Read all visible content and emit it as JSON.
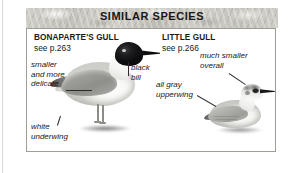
{
  "header": {
    "title": "SIMILAR SPECIES"
  },
  "species": [
    {
      "id": "bonapartes-gull",
      "name": "BONAPARTE'S GULL",
      "page_reference": "see p.263",
      "illustration": "standing-gull-black-hood"
    },
    {
      "id": "little-gull",
      "name": "LITTLE GULL",
      "page_reference": "see p.266",
      "illustration": "sitting-gull-dark-eye-patch"
    }
  ],
  "annotations": [
    {
      "id": "smaller-and-more-delicate",
      "line1": "smaller",
      "line2": "and more",
      "line3": "delicate",
      "points_to": "bonapartes-gull-body"
    },
    {
      "id": "black-bill",
      "line1": "black",
      "line2": "bill",
      "points_to": "bonapartes-gull-bill"
    },
    {
      "id": "white-underwing",
      "line1": "white",
      "line2": "underwing",
      "points_to": "bonapartes-gull-underwing"
    },
    {
      "id": "much-smaller-overall",
      "line1": "much smaller",
      "line2": "overall",
      "points_to": "little-gull-body"
    },
    {
      "id": "all-gray-upperwing",
      "line1": "all gray",
      "line2": "upperwing",
      "points_to": "little-gull-wing"
    }
  ],
  "colors": {
    "header_band": "#c6c5be",
    "panel_background": "#ffffff",
    "panel_border": "#9e9e97",
    "text": "#17171a",
    "hood_black": "#0c0c0e",
    "wing_gray": "#9d9d99"
  }
}
